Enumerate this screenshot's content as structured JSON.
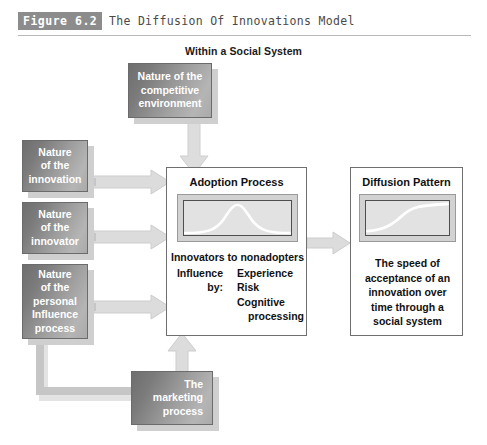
{
  "figure": {
    "number_label": "Figure 6.2",
    "title": "The Diffusion Of Innovations Model",
    "subtitle": "Within a Social System"
  },
  "nodes": {
    "competitive_environment": {
      "lines": [
        "Nature of the",
        "competitive",
        "environment"
      ],
      "line1": "Nature of the",
      "line2": "competitive",
      "line3": "environment"
    },
    "nature_innovation": {
      "line1": "Nature",
      "line2": "of the",
      "line3": "innovation"
    },
    "nature_innovator": {
      "line1": "Nature",
      "line2": "of the",
      "line3": "innovator"
    },
    "personal_influence": {
      "line1": "Nature",
      "line2": "of the",
      "line3": "personal",
      "line4": "Influence",
      "line5": "process"
    },
    "marketing_process": {
      "line1": "The",
      "line2": "marketing",
      "line3": "process"
    },
    "adoption_process": {
      "title": "Adoption Process",
      "heading": "Innovators to nonadopters",
      "influence_label_line1": "Influence",
      "influence_label_line2": "by:",
      "factors": [
        "Experience",
        "Risk",
        "Cognitive",
        "processing"
      ],
      "factor1": "Experience",
      "factor2": "Risk",
      "factor3": "Cognitive",
      "factor4": "processing"
    },
    "diffusion_pattern": {
      "title": "Diffusion Pattern",
      "line1": "The speed of",
      "line2": "acceptance of an",
      "line3": "innovation over",
      "line4": "time through a",
      "line5": "social system"
    }
  },
  "charts": {
    "adoption_curve": {
      "type": "line",
      "shape": "bell-curve",
      "description": "Normal distribution of adopters over time",
      "color": "#ffffff"
    },
    "diffusion_curve": {
      "type": "line",
      "shape": "s-curve",
      "description": "Cumulative S-shaped diffusion of adoption over time",
      "color": "#ffffff"
    }
  },
  "colors": {
    "box_fill_dark": "#6e6e6e",
    "box_fill_light": "#b5b5b5",
    "box_text": "#ffffff",
    "panel_border": "#6f6f6f",
    "chart_bg": "#e2e2e2",
    "chart_frame": "#d2d2d2",
    "arrow": "#d9d9d9",
    "figure_badge_bg": "#8c8c8c"
  }
}
